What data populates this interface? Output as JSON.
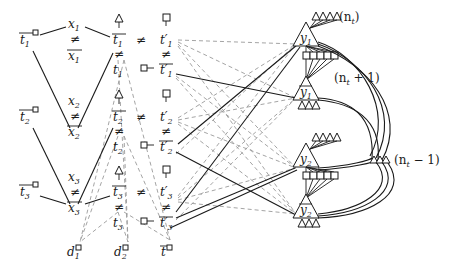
{
  "diagram": {
    "left_gadgets": [
      {
        "var": "x",
        "index": "1",
        "tbar": "t",
        "tindex": "1"
      },
      {
        "var": "x",
        "index": "2",
        "tbar": "t",
        "tindex": "2"
      },
      {
        "var": "x",
        "index": "3",
        "tbar": "t",
        "tindex": "3"
      }
    ],
    "neq_symbol": "≠",
    "middle_column": [
      {
        "top": "t̄",
        "bottom": "t",
        "index": "1"
      },
      {
        "top": "t̄",
        "bottom": "t",
        "index": "2"
      },
      {
        "top": "t̄",
        "bottom": "t",
        "index": "3"
      }
    ],
    "prime_column": [
      {
        "top": "t′",
        "bottom": "t̄′",
        "index": "1"
      },
      {
        "top": "t′",
        "bottom": "t̄′",
        "index": "2"
      },
      {
        "top": "t′",
        "bottom": "t̄′",
        "index": "3"
      }
    ],
    "bottom_nodes": [
      {
        "label": "d",
        "index": "1"
      },
      {
        "label": "d",
        "index": "2"
      },
      {
        "label": "t̄",
        "index": ""
      }
    ],
    "y_gadgets": [
      {
        "top": "y",
        "bottom": "ȳ",
        "index": "1"
      },
      {
        "top": "y",
        "bottom": "ȳ",
        "index": "2"
      }
    ],
    "annotations": {
      "top_triangles": "(n",
      "top_triangles_sub": "t",
      "top_triangles_close": ")",
      "squares": "(n",
      "squares_sub": "t",
      "squares_close": " + 1)",
      "right_triangles": "(n",
      "right_triangles_sub": "t",
      "right_triangles_close": " − 1)"
    },
    "labels": {
      "x1": "x",
      "x1s": "1",
      "x2": "x",
      "x2s": "2",
      "x3": "x",
      "x3s": "3",
      "xb1": "x",
      "xb1s": "1",
      "xb2": "x",
      "xb2s": "2",
      "xb3": "x",
      "xb3s": "3",
      "tl1": "t",
      "tl1s": "1",
      "tl2": "t",
      "tl2s": "2",
      "tl3": "t",
      "tl3s": "3",
      "tm_bar": "t",
      "tm": "t",
      "tp": "t′",
      "tpb": "t′",
      "y": "y",
      "d": "d",
      "d1s": "1",
      "d2s": "2",
      "tbar_bottom": "t",
      "s1": "1",
      "s2": "2",
      "s3": "3",
      "neq": "≠"
    }
  }
}
